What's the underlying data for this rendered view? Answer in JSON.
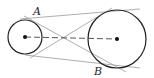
{
  "diagram": {
    "type": "two circles with common tangents",
    "labels": {
      "point_a": "A",
      "point_b": "B"
    },
    "circles": [
      {
        "name": "small-circle",
        "cx": 25,
        "cy": 37,
        "r": 17
      },
      {
        "name": "large-circle",
        "cx": 117,
        "cy": 39,
        "r": 29
      }
    ],
    "colors": {
      "stroke": "#222222",
      "tangent": "#888888"
    }
  }
}
